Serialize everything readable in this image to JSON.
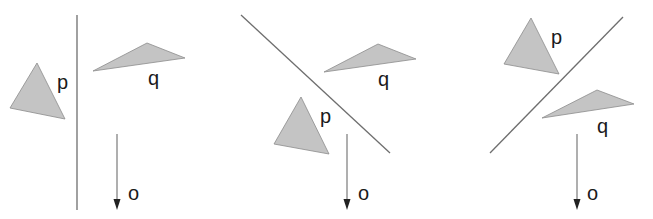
{
  "figure": {
    "colors": {
      "triangle_fill": "#c4c4c4",
      "triangle_stroke": "#8c8c8c",
      "line": "#6e6e6e",
      "text": "#1a1a1a"
    },
    "panels": [
      {
        "id": "panel-1",
        "separator": {
          "x1": 77,
          "y1": 15,
          "x2": 77,
          "y2": 210
        },
        "triangle_p": {
          "label": "p",
          "points": "37,63 10,108 65,119",
          "label_pos": [
            57,
            89
          ]
        },
        "triangle_q": {
          "label": "q",
          "points": "93,71 147,43 185,58",
          "label_pos": [
            148,
            85
          ]
        },
        "arrow_o": {
          "label": "o",
          "x": 117,
          "y1": 134,
          "y2": 210,
          "label_pos": [
            128,
            200
          ]
        }
      },
      {
        "id": "panel-2",
        "separator": {
          "x1": 241,
          "y1": 15,
          "x2": 390,
          "y2": 153
        },
        "triangle_p": {
          "label": "p",
          "points": "301,97 274,144 329,154",
          "label_pos": [
            320,
            123
          ]
        },
        "triangle_q": {
          "label": "q",
          "points": "324,72 378,44 416,59",
          "label_pos": [
            378,
            86
          ]
        },
        "arrow_o": {
          "label": "o",
          "x": 347,
          "y1": 134,
          "y2": 210,
          "label_pos": [
            358,
            200
          ]
        }
      },
      {
        "id": "panel-3",
        "separator": {
          "x1": 623,
          "y1": 17,
          "x2": 490,
          "y2": 153
        },
        "triangle_p": {
          "label": "p",
          "points": "531,18 504,64 559,74",
          "label_pos": [
            551,
            44
          ]
        },
        "triangle_q": {
          "label": "q",
          "points": "542,118 597,90 634,104",
          "label_pos": [
            597,
            133
          ]
        },
        "arrow_o": {
          "label": "o",
          "x": 577,
          "y1": 134,
          "y2": 210,
          "label_pos": [
            587,
            200
          ]
        }
      }
    ]
  }
}
